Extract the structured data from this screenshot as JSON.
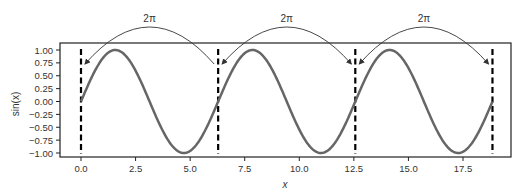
{
  "chart_data": {
    "type": "line",
    "title": "",
    "xlabel": "x",
    "ylabel": "sin(x)",
    "xlim": [
      -1.0,
      19.7
    ],
    "ylim": [
      -1.1,
      1.1
    ],
    "x_ticks": [
      0.0,
      2.5,
      5.0,
      7.5,
      10.0,
      12.5,
      15.0,
      17.5
    ],
    "x_tick_labels": [
      "0.0",
      "2.5",
      "5.0",
      "7.5",
      "10.0",
      "12.5",
      "15.0",
      "17.5"
    ],
    "y_ticks": [
      1.0,
      0.75,
      0.5,
      0.25,
      0.0,
      -0.25,
      -0.5,
      -0.75,
      -1.0
    ],
    "y_tick_labels": [
      "1.00",
      "0.75",
      "0.50",
      "0.25",
      "0.00",
      "−0.25",
      "−0.50",
      "−0.75",
      "−1.00"
    ],
    "grid": false,
    "series": [
      {
        "name": "sin(x)",
        "function": "sin",
        "x_range": [
          0,
          18.85
        ],
        "color": "#666666"
      }
    ],
    "vertical_lines": [
      {
        "x": 0.0,
        "style": "dashed",
        "color": "#000000"
      },
      {
        "x": 6.283,
        "style": "dashed",
        "color": "#000000"
      },
      {
        "x": 12.566,
        "style": "dashed",
        "color": "#000000"
      },
      {
        "x": 18.85,
        "style": "dashed",
        "color": "#000000"
      }
    ],
    "annotations": [
      {
        "text": "2π",
        "from": 6.283,
        "to": 0.0,
        "type": "curved-arrow"
      },
      {
        "text": "2π",
        "from": 6.283,
        "to": 12.566,
        "type": "curved-arrow-double"
      },
      {
        "text": "2π",
        "from": 12.566,
        "to": 18.85,
        "type": "curved-arrow-double"
      }
    ]
  }
}
